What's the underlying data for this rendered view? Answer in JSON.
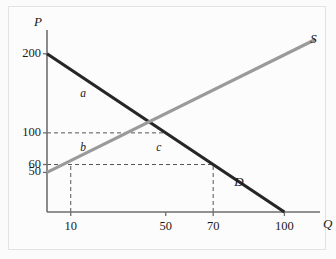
{
  "figure": {
    "background_color": "#fbfbfb",
    "frame_color": "#e3e3e3"
  },
  "chart_data": {
    "type": "line",
    "title": "",
    "xlabel": "Q",
    "ylabel": "P",
    "xlim": [
      0,
      115
    ],
    "ylim": [
      0,
      230
    ],
    "grid": false,
    "legend": "inline-curve-labels",
    "x_ticks": [
      {
        "value": 10,
        "label": "10"
      },
      {
        "value": 50,
        "label": "50"
      },
      {
        "value": 70,
        "label": "70"
      },
      {
        "value": 100,
        "label": "100"
      }
    ],
    "y_ticks": [
      {
        "value": 200,
        "label": "200"
      },
      {
        "value": 100,
        "label": "100"
      },
      {
        "value": 60,
        "label": "60"
      },
      {
        "value": 50,
        "label": "50"
      }
    ],
    "series": [
      {
        "name": "D",
        "label": "D",
        "color": "#262626",
        "width": 3.2,
        "points": [
          [
            0,
            200
          ],
          [
            100,
            0
          ]
        ]
      },
      {
        "name": "S",
        "label": "S",
        "color": "#9a9a9a",
        "width": 3.2,
        "points": [
          [
            0,
            50
          ],
          [
            113,
            218
          ]
        ]
      }
    ],
    "equilibrium": {
      "q": 50,
      "p": 100
    },
    "annotations": [
      {
        "name": "a",
        "label": "a",
        "q": 14,
        "p": 148
      },
      {
        "name": "b",
        "label": "b",
        "q": 14,
        "p": 80
      },
      {
        "name": "c",
        "label": "c",
        "q": 46,
        "p": 80
      }
    ],
    "guide_lines": [
      {
        "name": "price-100-horizontal",
        "orientation": "horizontal",
        "value": 100,
        "from": 0,
        "to": 50
      },
      {
        "name": "price-60-horizontal",
        "orientation": "horizontal",
        "value": 60,
        "from": 0,
        "to": 70
      },
      {
        "name": "quantity-10-vertical",
        "orientation": "vertical",
        "value": 10,
        "from": 0,
        "to": 60
      },
      {
        "name": "quantity-70-vertical",
        "orientation": "vertical",
        "value": 70,
        "from": 0,
        "to": 60
      }
    ],
    "axis_labels": {
      "x": "Q",
      "y": "P"
    }
  }
}
